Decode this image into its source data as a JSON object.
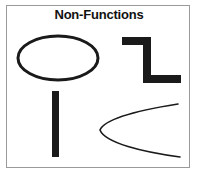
{
  "figure": {
    "title": "Non-Functions",
    "background_color": "#ffffff",
    "frame_color": "#9a9a9a",
    "ink_color": "#1a1a1a",
    "width": 198,
    "height": 175
  },
  "shapes": [
    {
      "id": "ellipse",
      "name": "ellipse-shape",
      "label": "Ellipse",
      "type": "ellipse",
      "cx": 58,
      "cy": 58,
      "rx": 40,
      "ry": 22,
      "stroke_width": 3,
      "fill": "none"
    },
    {
      "id": "step",
      "name": "step-shape",
      "label": "Z-step",
      "type": "polyline",
      "points": "122,41 147,41 147,79 181,79",
      "stroke_width": 8,
      "fill": "none"
    },
    {
      "id": "vertical-bar",
      "name": "vertical-line-shape",
      "label": "Vertical line",
      "type": "rect",
      "x": 52,
      "y": 91,
      "width": 7,
      "height": 66,
      "fill": "#1a1a1a"
    },
    {
      "id": "parabola",
      "name": "sideways-parabola-shape",
      "label": "Sideways parabola",
      "type": "path",
      "d": "M 178 104 C 140 110 105 118 100 130 C 105 143 143 152 180 157",
      "stroke_width": 1.6,
      "fill": "none"
    }
  ]
}
